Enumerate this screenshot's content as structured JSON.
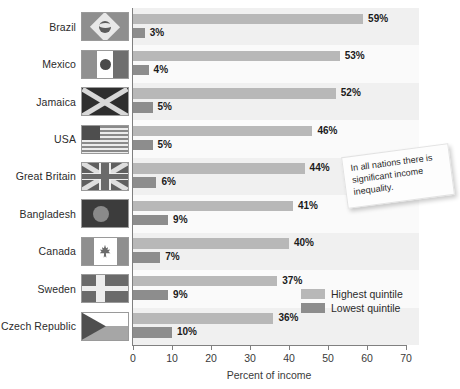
{
  "chart_data": {
    "type": "bar",
    "title": "",
    "orientation": "horizontal",
    "xlabel": "Percent of income",
    "ylabel": "",
    "xlim": [
      0,
      70
    ],
    "xticks": [
      0,
      10,
      20,
      30,
      40,
      50,
      60,
      70
    ],
    "grid": false,
    "legend_position": "bottom-right",
    "categories": [
      "Brazil",
      "Mexico",
      "Jamaica",
      "USA",
      "Great Britain",
      "Bangladesh",
      "Canada",
      "Sweden",
      "Czech Republic"
    ],
    "series": [
      {
        "name": "Highest quintile",
        "color": "#b8b8b8",
        "values": [
          59,
          53,
          52,
          46,
          44,
          41,
          40,
          37,
          36
        ],
        "labels": [
          "59%",
          "53%",
          "52%",
          "46%",
          "44%",
          "41%",
          "40%",
          "37%",
          "36%"
        ]
      },
      {
        "name": "Lowest quintile",
        "color": "#8d8d8d",
        "values": [
          3,
          4,
          5,
          5,
          6,
          9,
          7,
          9,
          10
        ],
        "labels": [
          "3%",
          "4%",
          "5%",
          "5%",
          "6%",
          "9%",
          "7%",
          "9%",
          "10%"
        ]
      }
    ],
    "annotations": [
      {
        "text": "In all nations there is significant income inequality."
      }
    ]
  },
  "axis": {
    "tick_labels": [
      "0",
      "10",
      "20",
      "30",
      "40",
      "50",
      "60",
      "70"
    ],
    "title": "Percent of income"
  },
  "legend": {
    "items": [
      {
        "label": "Highest quintile",
        "color": "#b8b8b8"
      },
      {
        "label": "Lowest quintile",
        "color": "#8d8d8d"
      }
    ]
  },
  "note": {
    "text": "In all nations there is significant income inequality."
  },
  "rows": [
    {
      "country": "Brazil",
      "flag": "brazil-flag",
      "high": 59,
      "high_label": "59%",
      "low": 3,
      "low_label": "3%"
    },
    {
      "country": "Mexico",
      "flag": "mexico-flag",
      "high": 53,
      "high_label": "53%",
      "low": 4,
      "low_label": "4%"
    },
    {
      "country": "Jamaica",
      "flag": "jamaica-flag",
      "high": 52,
      "high_label": "52%",
      "low": 5,
      "low_label": "5%"
    },
    {
      "country": "USA",
      "flag": "usa-flag",
      "high": 46,
      "high_label": "46%",
      "low": 5,
      "low_label": "5%"
    },
    {
      "country": "Great Britain",
      "flag": "great-britain-flag",
      "high": 44,
      "high_label": "44%",
      "low": 6,
      "low_label": "6%"
    },
    {
      "country": "Bangladesh",
      "flag": "bangladesh-flag",
      "high": 41,
      "high_label": "41%",
      "low": 9,
      "low_label": "9%"
    },
    {
      "country": "Canada",
      "flag": "canada-flag",
      "high": 40,
      "high_label": "40%",
      "low": 7,
      "low_label": "7%"
    },
    {
      "country": "Sweden",
      "flag": "sweden-flag",
      "high": 37,
      "high_label": "37%",
      "low": 9,
      "low_label": "9%"
    },
    {
      "country": "Czech Republic",
      "flag": "czech-republic-flag",
      "high": 36,
      "high_label": "36%",
      "low": 10,
      "low_label": "10%"
    }
  ]
}
